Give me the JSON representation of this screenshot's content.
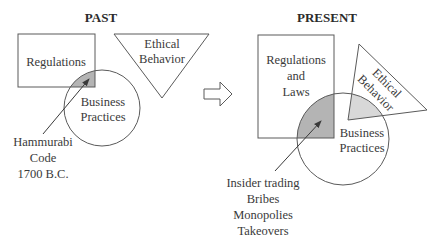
{
  "past": {
    "title": "PAST",
    "regulations": "Regulations",
    "ethical": [
      "Ethical",
      "Behavior"
    ],
    "business": [
      "Business",
      "Practices"
    ],
    "annotation": [
      "Hammurabi",
      "Code",
      "1700 B.C."
    ]
  },
  "present": {
    "title": "PRESENT",
    "regulations": [
      "Regulations",
      "and",
      "Laws"
    ],
    "ethical": [
      "Ethical",
      "Behavior"
    ],
    "business": [
      "Business",
      "Practices"
    ],
    "annotation": [
      "Insider trading",
      "Bribes",
      "Monopolies",
      "Takeovers"
    ]
  },
  "colors": {
    "stroke": "#5a5a5a",
    "shade_dark": "#b4b4b4",
    "shade_light": "#d8d8d8"
  }
}
